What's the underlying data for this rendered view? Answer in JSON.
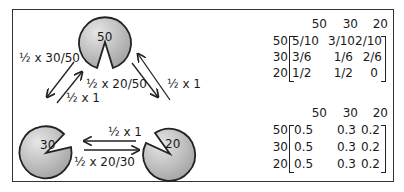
{
  "nodes": [
    {
      "id": "n50",
      "label": "50"
    },
    {
      "id": "n30",
      "label": "30"
    },
    {
      "id": "n20",
      "label": "20"
    }
  ],
  "edges": {
    "n50_to_n30": "½ x 30/50",
    "n30_to_n50": "½ x 1",
    "n50_to_n20": "½ x 20/50",
    "n20_to_n50": "½ x 1",
    "n20_to_n30": "½ x 1",
    "n30_to_n20": "½ x 20/30"
  },
  "matrix_top": {
    "col_headers": [
      "50",
      "30",
      "20"
    ],
    "row_headers": [
      "50",
      "30",
      "20"
    ],
    "rows": [
      [
        "5/10",
        "3/10",
        "2/10"
      ],
      [
        "3/6",
        "1/6",
        "2/6"
      ],
      [
        "1/2",
        "1/2",
        "0"
      ]
    ]
  },
  "matrix_bottom": {
    "col_headers": [
      "50",
      "30",
      "20"
    ],
    "row_headers": [
      "50",
      "30",
      "20"
    ],
    "rows": [
      [
        "0.5",
        "0.3",
        "0.2"
      ],
      [
        "0.5",
        "0.3",
        "0.2"
      ],
      [
        "0.5",
        "0.3",
        "0.2"
      ]
    ]
  },
  "colors": {
    "node_fill_light": "#e2e2e2",
    "node_fill_dark": "#a8a8a8",
    "stroke": "#222222"
  }
}
